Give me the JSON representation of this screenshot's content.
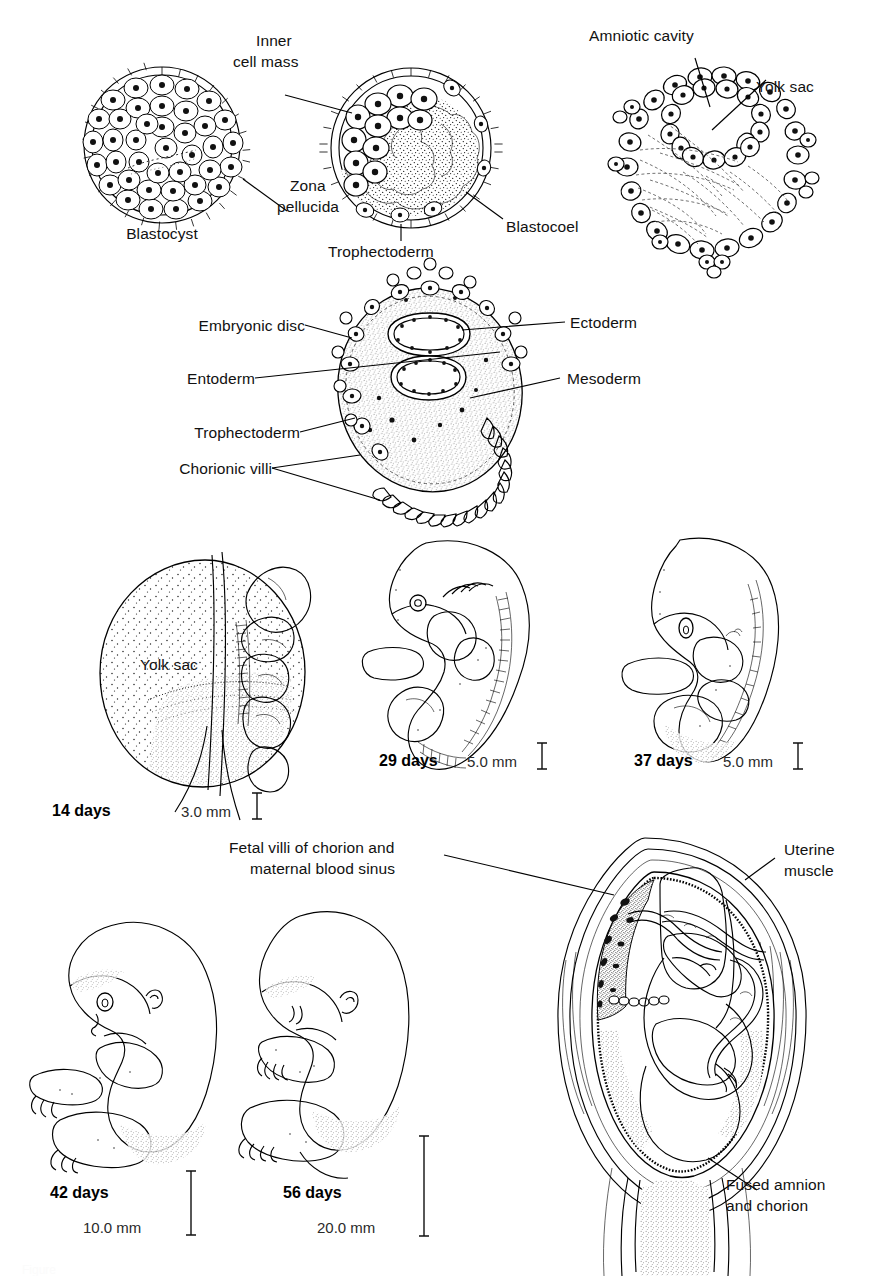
{
  "figure": {
    "line_color": "#000000",
    "background": "#ffffff"
  },
  "row1": {
    "name": "early-cleavage-and-blastocyst-row",
    "panels": [
      {
        "id": "blastocyst",
        "caption": "Blastocyst",
        "labels": [
          {
            "key": "zona_pellucida",
            "text": "Zona\npellucida",
            "lines": [
              "Zona",
              "pellucida"
            ]
          }
        ]
      },
      {
        "id": "inner-cell-mass-blastocyst",
        "labels": [
          {
            "key": "inner_cell_mass",
            "text": "Inner\ncell mass",
            "lines": [
              "Inner",
              "cell mass"
            ]
          },
          {
            "key": "trophectoderm",
            "text": "Trophectoderm"
          },
          {
            "key": "blastocoel",
            "text": "Blastocoel"
          }
        ]
      },
      {
        "id": "bilaminar-germ-disc",
        "labels": [
          {
            "key": "amniotic_cavity",
            "text": "Amniotic cavity"
          },
          {
            "key": "yolk_sac",
            "text": "Yolk sac"
          }
        ]
      }
    ]
  },
  "row2": {
    "name": "implanted-conceptus-panel",
    "labels_left": [
      {
        "key": "embryonic_disc",
        "text": "Embryonic disc"
      },
      {
        "key": "entoderm",
        "text": "Entoderm"
      },
      {
        "key": "trophectoderm",
        "text": "Trophectoderm"
      },
      {
        "key": "chorionic_villi",
        "text": "Chorionic villi"
      }
    ],
    "labels_right": [
      {
        "key": "ectoderm",
        "text": "Ectoderm"
      },
      {
        "key": "mesoderm",
        "text": "Mesoderm"
      }
    ]
  },
  "row3": {
    "name": "embryo-stages-row",
    "stages": [
      {
        "id": "stage-14-days",
        "day_label": "14 days",
        "scale_label": "3.0 mm",
        "inner_label": "Yolk sac"
      },
      {
        "id": "stage-29-days",
        "day_label": "29 days",
        "scale_label": "5.0 mm"
      },
      {
        "id": "stage-37-days",
        "day_label": "37 days",
        "scale_label": "5.0 mm"
      }
    ]
  },
  "row4": {
    "name": "fetus-stages-and-uterus-row",
    "stages": [
      {
        "id": "stage-42-days",
        "day_label": "42 days",
        "scale_label": "10.0 mm"
      },
      {
        "id": "stage-56-days",
        "day_label": "56 days",
        "scale_label": "20.0 mm"
      }
    ],
    "uterus": {
      "id": "uterus-with-fetus",
      "labels": [
        {
          "key": "fetal_villi",
          "text": "Fetal villi of chorion and\nmaternal blood sinus",
          "lines": [
            "Fetal villi of chorion and",
            "maternal blood sinus"
          ]
        },
        {
          "key": "uterine_muscle",
          "text": "Uterine\nmuscle",
          "lines": [
            "Uterine",
            "muscle"
          ]
        },
        {
          "key": "fused_amnion",
          "text": "Fused amnion\nand chorion",
          "lines": [
            "Fused amnion",
            "and chorion"
          ]
        }
      ]
    }
  },
  "footer": {
    "cut_off_caption": "Figure"
  }
}
